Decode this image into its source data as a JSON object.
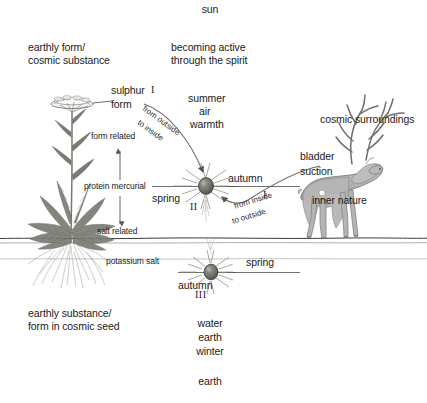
{
  "diagram": {
    "title_top": "sun",
    "title_bottom": "earth",
    "background_color": "#ffffff",
    "ink_color": "#1a1a1a",
    "plant_color": "#6f6f6f",
    "deer_color": "#b4b4b4"
  },
  "labels": {
    "sun": "sun",
    "earth": "earth",
    "earthly_form": "earthly form/\ncosmic substance",
    "becoming_active": "becoming active\nthrough the spirit",
    "cosmic_surroundings": "cosmic surroundings",
    "earthly_substance": "earthly substance/\nform in cosmic seed",
    "sulphur": "sulphur",
    "form": "form",
    "form_related": "form related",
    "protein_mercurial": "protein mercurial",
    "salt_related": "salt related",
    "potassium_salt": "potassium salt",
    "summer": "summer",
    "air": "air",
    "warmth": "warmth",
    "spring_upper": "spring",
    "autumn_upper": "autumn",
    "spring_lower": "spring",
    "autumn_lower": "autumn",
    "water": "water",
    "earth_elem": "earth",
    "winter": "winter",
    "bladder": "bladder",
    "suction": "suction",
    "inner_nature": "inner nature"
  },
  "arcs": {
    "outside_in_a": "from outside",
    "outside_in_b": "to inside",
    "inside_out_a": "from inside",
    "inside_out_b": "to outside"
  },
  "numerals": {
    "one_top": "I",
    "two": "II",
    "three": "III",
    "one_right": "I"
  },
  "icons": {
    "seed_upper": "seed-star-icon",
    "seed_lower": "seed-star-icon",
    "plant": "yarrow-plant-icon",
    "deer": "stag-icon",
    "bladder_dot": "bladder-dot-icon"
  }
}
